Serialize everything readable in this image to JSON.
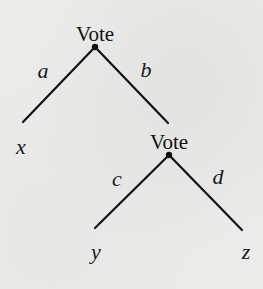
{
  "diagram": {
    "type": "game-tree",
    "nodes": [
      {
        "id": "root",
        "label": "Vote"
      },
      {
        "id": "second",
        "label": "Vote"
      }
    ],
    "edges": [
      {
        "from": "root",
        "to": "x",
        "label": "a"
      },
      {
        "from": "root",
        "to": "second",
        "label": "b"
      },
      {
        "from": "second",
        "to": "y",
        "label": "c"
      },
      {
        "from": "second",
        "to": "z",
        "label": "d"
      }
    ],
    "leaves": [
      {
        "id": "x",
        "label": "x"
      },
      {
        "id": "y",
        "label": "y"
      },
      {
        "id": "z",
        "label": "z"
      }
    ],
    "colors": {
      "line": "#111111",
      "background": "#ebebea"
    }
  }
}
